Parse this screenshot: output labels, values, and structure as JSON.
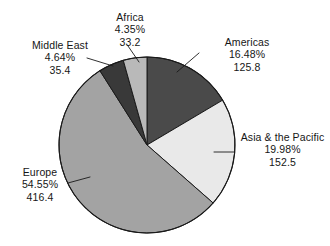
{
  "chart_data": {
    "type": "pie",
    "title": "",
    "subtitle": "",
    "xlabel": "",
    "ylabel": "",
    "legend_position": "none",
    "grid": false,
    "label_format": "name, percent, value",
    "total": 763.3,
    "categories": [
      "Americas",
      "Asia & the Pacific",
      "Europe",
      "Middle East",
      "Africa"
    ],
    "values": [
      125.8,
      152.5,
      416.4,
      35.4,
      33.2
    ],
    "percentages": [
      16.48,
      19.98,
      54.55,
      4.64,
      4.35
    ],
    "colors": [
      "#4a4a4a",
      "#e9e9e9",
      "#a3a3a3",
      "#393939",
      "#b9b9b9"
    ],
    "start_angle_deg": 0,
    "direction": "clockwise",
    "slices": [
      {
        "name": "Americas",
        "percent_text": "16.48%",
        "value_text": "125.8",
        "percent": 16.48,
        "value": 125.8,
        "color": "#4a4a4a",
        "start_deg": 0,
        "end_deg": 59.33
      },
      {
        "name": "Asia & the Pacific",
        "percent_text": "19.98%",
        "value_text": "152.5",
        "percent": 19.98,
        "value": 152.5,
        "color": "#e9e9e9",
        "start_deg": 59.33,
        "end_deg": 131.26
      },
      {
        "name": "Europe",
        "percent_text": "54.55%",
        "value_text": "416.4",
        "percent": 54.55,
        "value": 416.4,
        "color": "#a3a3a3",
        "start_deg": 131.26,
        "end_deg": 327.64
      },
      {
        "name": "Middle East",
        "percent_text": "4.64%",
        "value_text": "35.4",
        "percent": 4.64,
        "value": 35.4,
        "color": "#393939",
        "start_deg": 327.64,
        "end_deg": 344.34
      },
      {
        "name": "Africa",
        "percent_text": "4.35%",
        "value_text": "33.2",
        "percent": 4.35,
        "value": 33.2,
        "color": "#b9b9b9",
        "start_deg": 344.34,
        "end_deg": 360
      }
    ]
  },
  "labels": {
    "africa": {
      "name": "Africa",
      "percent": "4.35%",
      "value": "33.2"
    },
    "middle_east": {
      "name": "Middle East",
      "percent": "4.64%",
      "value": "35.4"
    },
    "americas": {
      "name": "Americas",
      "percent": "16.48%",
      "value": "125.8"
    },
    "asia": {
      "name": "Asia & the Pacific",
      "percent": "19.98%",
      "value": "152.5"
    },
    "europe": {
      "name": "Europe",
      "percent": "54.55%",
      "value": "416.4"
    }
  },
  "style": {
    "background": "#ffffff",
    "outline": "#1a1a1a",
    "leader_line": "#1a1a1a",
    "text": "#161616"
  }
}
